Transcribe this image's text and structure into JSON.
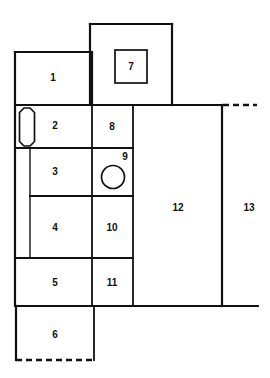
{
  "diagram": {
    "background_color": "#ffffff",
    "line_color": "#111111",
    "regions": [
      {
        "id": "region-1",
        "label": "1",
        "label_x": 53,
        "label_y": 78,
        "x": 15,
        "y": 52,
        "w": 77,
        "h": 53
      },
      {
        "id": "region-2",
        "label": "2",
        "label_x": 55,
        "label_y": 126,
        "x": 15,
        "y": 105,
        "w": 77,
        "h": 43
      },
      {
        "id": "region-3",
        "label": "3",
        "label_x": 55,
        "label_y": 172,
        "x": 30,
        "y": 148,
        "w": 62,
        "h": 48
      },
      {
        "id": "region-4",
        "label": "4",
        "label_x": 55,
        "label_y": 228,
        "x": 30,
        "y": 196,
        "w": 62,
        "h": 62
      },
      {
        "id": "region-5",
        "label": "5",
        "label_x": 55,
        "label_y": 283,
        "x": 15,
        "y": 258,
        "w": 77,
        "h": 48
      },
      {
        "id": "region-6",
        "label": "6",
        "label_x": 55,
        "label_y": 335,
        "x": 15,
        "y": 306,
        "w": 79,
        "h": 54
      },
      {
        "id": "region-7",
        "label": "7",
        "label_x": 131,
        "label_y": 67,
        "x": 115,
        "y": 50,
        "w": 32,
        "h": 33
      },
      {
        "id": "region-8",
        "label": "8",
        "label_x": 112,
        "label_y": 127,
        "x": 92,
        "y": 105,
        "w": 41,
        "h": 43
      },
      {
        "id": "region-9",
        "label": "9",
        "label_x": 125,
        "label_y": 157,
        "x": 92,
        "y": 148,
        "w": 41,
        "h": 48
      },
      {
        "id": "region-10",
        "label": "10",
        "label_x": 112,
        "label_y": 228,
        "x": 92,
        "y": 196,
        "w": 41,
        "h": 62
      },
      {
        "id": "region-11",
        "label": "11",
        "label_x": 112,
        "label_y": 283,
        "x": 92,
        "y": 258,
        "w": 41,
        "h": 48
      },
      {
        "id": "region-12",
        "label": "12",
        "label_x": 178,
        "label_y": 208,
        "x": 133,
        "y": 105,
        "w": 89,
        "h": 201
      },
      {
        "id": "region-13",
        "label": "13",
        "label_x": 249,
        "label_y": 208,
        "x": 222,
        "y": 105,
        "w": 36,
        "h": 201
      }
    ],
    "glyphs": [
      {
        "id": "glyph-octagon-region-2",
        "name": "octagon-shape",
        "shape": "octagon",
        "cx": 27,
        "cy": 127,
        "rx": 7.5,
        "ry": 19
      },
      {
        "id": "glyph-circle-region-9",
        "name": "circle-shape",
        "shape": "circle",
        "cx": 113,
        "cy": 177,
        "r": 11.5
      },
      {
        "id": "glyph-square-region-7",
        "name": "square-shape",
        "shape": "square",
        "x": 115,
        "y": 50,
        "w": 32,
        "h": 33
      }
    ],
    "solid_edges": [
      {
        "id": "e-outer-top-7",
        "x1": 90,
        "y1": 24,
        "x2": 172,
        "y2": 24,
        "weight": "thick"
      },
      {
        "id": "e-outer-left-7",
        "x1": 90,
        "y1": 24,
        "x2": 90,
        "y2": 105,
        "weight": "thick"
      },
      {
        "id": "e-outer-right-7",
        "x1": 172,
        "y1": 24,
        "x2": 172,
        "y2": 105,
        "weight": "thick"
      },
      {
        "id": "e-top-1",
        "x1": 15,
        "y1": 52,
        "x2": 92,
        "y2": 52,
        "weight": "thick"
      },
      {
        "id": "e-left-upper",
        "x1": 15,
        "y1": 52,
        "x2": 15,
        "y2": 306,
        "weight": "thick"
      },
      {
        "id": "e-left-lower",
        "x1": 16,
        "y1": 306,
        "x2": 16,
        "y2": 360,
        "weight": "thick"
      },
      {
        "id": "e-div-1-2",
        "x1": 15,
        "y1": 105,
        "x2": 92,
        "y2": 105,
        "weight": "med"
      },
      {
        "id": "e-div-2-3",
        "x1": 15,
        "y1": 148,
        "x2": 92,
        "y2": 148,
        "weight": "med"
      },
      {
        "id": "e-div-3-4",
        "x1": 30,
        "y1": 196,
        "x2": 92,
        "y2": 196,
        "weight": "med"
      },
      {
        "id": "e-div-4-5",
        "x1": 15,
        "y1": 258,
        "x2": 92,
        "y2": 258,
        "weight": "med"
      },
      {
        "id": "e-div-5-6",
        "x1": 15,
        "y1": 306,
        "x2": 133,
        "y2": 306,
        "weight": "med"
      },
      {
        "id": "e-inner-vert-34",
        "x1": 30,
        "y1": 148,
        "x2": 30,
        "y2": 258,
        "weight": "thin"
      },
      {
        "id": "e-col1-right-top",
        "x1": 92,
        "y1": 52,
        "x2": 92,
        "y2": 105,
        "weight": "thick"
      },
      {
        "id": "e-col1-right-mid",
        "x1": 92,
        "y1": 105,
        "x2": 92,
        "y2": 306,
        "weight": "med"
      },
      {
        "id": "e-col2-right",
        "x1": 133,
        "y1": 105,
        "x2": 133,
        "y2": 306,
        "weight": "med"
      },
      {
        "id": "e-div-8-9",
        "x1": 92,
        "y1": 148,
        "x2": 133,
        "y2": 148,
        "weight": "med"
      },
      {
        "id": "e-div-9-10",
        "x1": 92,
        "y1": 196,
        "x2": 133,
        "y2": 196,
        "weight": "med"
      },
      {
        "id": "e-div-10-11",
        "x1": 92,
        "y1": 258,
        "x2": 133,
        "y2": 258,
        "weight": "med"
      },
      {
        "id": "e-top-right-band",
        "x1": 92,
        "y1": 105,
        "x2": 222,
        "y2": 105,
        "weight": "thick"
      },
      {
        "id": "e-right-12",
        "x1": 222,
        "y1": 105,
        "x2": 222,
        "y2": 306,
        "weight": "thick"
      },
      {
        "id": "e-bottom-13",
        "x1": 133,
        "y1": 306,
        "x2": 258,
        "y2": 306,
        "weight": "med"
      },
      {
        "id": "e-col1-right-bottom",
        "x1": 94,
        "y1": 306,
        "x2": 94,
        "y2": 360,
        "weight": "med"
      }
    ],
    "dashed_edges": [
      {
        "id": "e-dash-top-right",
        "x1": 223,
        "y1": 105,
        "x2": 257,
        "y2": 105
      },
      {
        "id": "e-dash-bottom-6",
        "x1": 16,
        "y1": 360,
        "x2": 94,
        "y2": 360
      }
    ]
  }
}
